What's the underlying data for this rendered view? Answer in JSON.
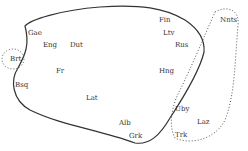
{
  "diagram": {
    "type": "language-area-map",
    "colors": {
      "line": "#333333",
      "text": "#333333",
      "background": "#ffffff"
    },
    "main_region": {
      "style": "solid",
      "labels": [
        {
          "text": "Gae",
          "x": 28,
          "y": 30
        },
        {
          "text": "Eng",
          "x": 43,
          "y": 42
        },
        {
          "text": "Dut",
          "x": 70,
          "y": 42
        },
        {
          "text": "Fin",
          "x": 159,
          "y": 17
        },
        {
          "text": "Ltv",
          "x": 163,
          "y": 30
        },
        {
          "text": "Rus",
          "x": 175,
          "y": 42
        },
        {
          "text": "Fr",
          "x": 56,
          "y": 68
        },
        {
          "text": "Hng",
          "x": 159,
          "y": 68
        },
        {
          "text": "Bsq",
          "x": 15,
          "y": 82
        },
        {
          "text": "Lat",
          "x": 86,
          "y": 95
        },
        {
          "text": "Alb",
          "x": 119,
          "y": 120
        },
        {
          "text": "Grk",
          "x": 129,
          "y": 133
        }
      ]
    },
    "breton_region": {
      "style": "dotted",
      "labels": [
        {
          "text": "Brt",
          "x": 10,
          "y": 56
        }
      ]
    },
    "eastern_region": {
      "style": "dotted",
      "labels": [
        {
          "text": "Nnts",
          "x": 220,
          "y": 17
        },
        {
          "text": "Uby",
          "x": 175,
          "y": 106
        },
        {
          "text": "Laz",
          "x": 197,
          "y": 119
        },
        {
          "text": "Trk",
          "x": 175,
          "y": 132
        }
      ]
    }
  }
}
